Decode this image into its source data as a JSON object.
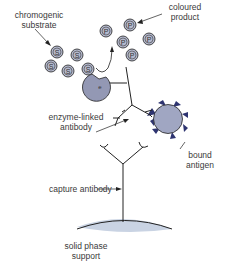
{
  "labels": {
    "chromogenic_substrate": [
      "chromogenic",
      "substrate"
    ],
    "coloured_product": [
      "coloured",
      "product"
    ],
    "enzyme_linked_antibody": [
      "enzyme-linked",
      "antibody"
    ],
    "bound_antigen": [
      "bound",
      "antigen"
    ],
    "capture_antibody": "capture antibody",
    "solid_phase_support": [
      "solid phase",
      "support"
    ]
  },
  "symbols": {
    "substrate": "S",
    "product": "P",
    "enzyme": "e"
  },
  "colors": {
    "molecule_fill": "#b4b8cc",
    "enzyme_fill": "#9398b4",
    "antigen_fill": "#a0a6c2",
    "antigen_spikes": "#2e3470",
    "support_fill": "#c9d3e3",
    "line": "#222222"
  }
}
